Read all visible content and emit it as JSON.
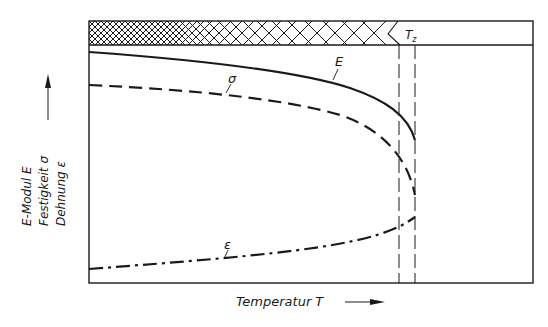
{
  "diagram": {
    "type": "material-properties-vs-temperature",
    "y_axis_label_lines": [
      "E-Modul E",
      "Festigkeit σ",
      "Dehnung ε"
    ],
    "x_axis_label": "Temperatur T",
    "temperature_marker": "T",
    "temperature_marker_subscript": "z",
    "curves": {
      "E": {
        "label": "E",
        "style": "solid",
        "trend": "slowly decreasing, sharp drop near Tz"
      },
      "sigma": {
        "label": "σ",
        "style": "dashed",
        "trend": "slowly decreasing, sharp drop near Tz"
      },
      "epsilon": {
        "label": "ε",
        "style": "dash-dot",
        "trend": "slowly increasing, steeper near Tz"
      }
    },
    "top_band": "cross-hatched band with hatch spacing widening toward Tz",
    "colors": {
      "ink": "#1a1a1a",
      "background": "#ffffff"
    }
  }
}
